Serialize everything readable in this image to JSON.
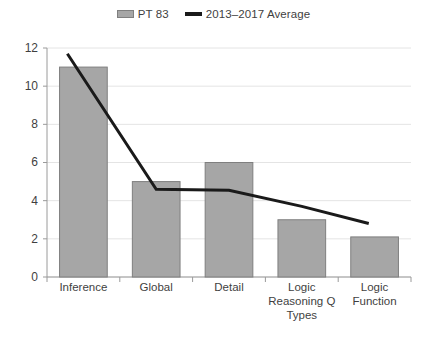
{
  "legend": {
    "position": "top-center",
    "entries": [
      {
        "label": "PT 83",
        "marker": "bar-swatch-icon",
        "color": "#a6a6a6"
      },
      {
        "label": "2013–2017 Average",
        "marker": "line-swatch-icon",
        "color": "#1a1a1a"
      }
    ]
  },
  "axis": {
    "y_ticks": [
      "12",
      "10",
      "8",
      "6",
      "4",
      "2",
      "0"
    ],
    "x_labels": [
      "Inference",
      "Global",
      "Detail",
      "Logic\nReasoning Q\nTypes",
      "Logic\nFunction"
    ]
  },
  "chart_data": {
    "type": "bar",
    "title": "",
    "subtitle": "",
    "xlabel": "",
    "ylabel": "",
    "ylim": [
      0,
      12
    ],
    "ytick_step": 2,
    "grid": true,
    "legend_position": "top-center",
    "categories": [
      "Inference",
      "Global",
      "Detail",
      "Logic Reasoning Q Types",
      "Logic Function"
    ],
    "series": [
      {
        "name": "PT 83",
        "type": "bar",
        "color": "#a6a6a6",
        "border_color": "#7f7f7f",
        "values": [
          11,
          5,
          6,
          3,
          2.1
        ]
      },
      {
        "name": "2013–2017 Average",
        "type": "line",
        "color": "#1a1a1a",
        "line_width": 3,
        "values": [
          11.7,
          4.6,
          4.55,
          3.7,
          2.8
        ],
        "note": "line starts above the first bar at the left edge and terminates before the right edge of the plot"
      }
    ]
  }
}
